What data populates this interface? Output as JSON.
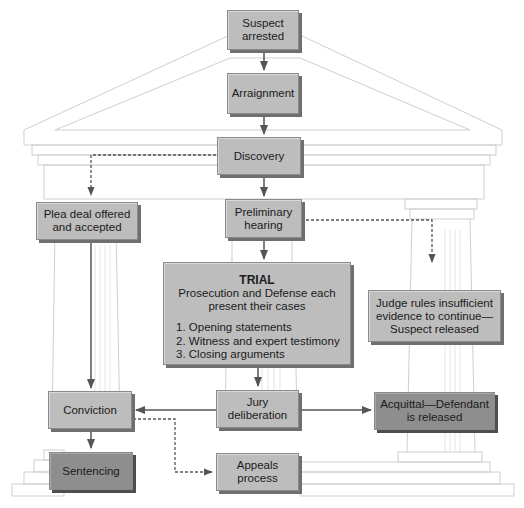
{
  "diagram": {
    "type": "flowchart",
    "theme": "criminal-justice-process-temple",
    "colors": {
      "box_fill": "#bdbdbd",
      "box_fill_dark": "#8e8e8e",
      "box_border": "#8a8a8a",
      "arrow": "#555555",
      "temple_line": "#cfcfcf"
    },
    "nodes": {
      "suspect_arrested": {
        "lines": [
          "Suspect",
          "arrested"
        ]
      },
      "arraignment": {
        "lines": [
          "Arraignment"
        ]
      },
      "discovery": {
        "lines": [
          "Discovery"
        ]
      },
      "plea_deal": {
        "lines": [
          "Plea deal offered",
          "and accepted"
        ]
      },
      "preliminary_hearing": {
        "lines": [
          "Preliminary",
          "hearing"
        ]
      },
      "trial": {
        "title": "TRIAL",
        "subtitle_lines": [
          "Prosecution and Defense each",
          "present their cases"
        ],
        "steps": [
          "1. Opening statements",
          "2. Witness and expert testimony",
          "3. Closing arguments"
        ]
      },
      "judge_rules": {
        "lines": [
          "Judge rules insufficient",
          "evidence to continue—",
          "Suspect released"
        ]
      },
      "conviction": {
        "lines": [
          "Conviction"
        ]
      },
      "jury_deliberation": {
        "lines": [
          "Jury",
          "deliberation"
        ]
      },
      "acquittal": {
        "lines": [
          "Acquittal—Defendant",
          "is released"
        ]
      },
      "sentencing": {
        "lines": [
          "Sentencing"
        ]
      },
      "appeals": {
        "lines": [
          "Appeals",
          "process"
        ]
      }
    },
    "edges": [
      {
        "from": "suspect_arrested",
        "to": "arraignment",
        "style": "solid"
      },
      {
        "from": "arraignment",
        "to": "discovery",
        "style": "solid"
      },
      {
        "from": "discovery",
        "to": "preliminary_hearing",
        "style": "solid"
      },
      {
        "from": "discovery",
        "to": "plea_deal",
        "style": "dashed"
      },
      {
        "from": "preliminary_hearing",
        "to": "trial",
        "style": "solid"
      },
      {
        "from": "preliminary_hearing",
        "to": "judge_rules",
        "style": "dashed"
      },
      {
        "from": "plea_deal",
        "to": "conviction",
        "style": "solid"
      },
      {
        "from": "trial",
        "to": "jury_deliberation",
        "style": "solid"
      },
      {
        "from": "jury_deliberation",
        "to": "conviction",
        "style": "solid"
      },
      {
        "from": "jury_deliberation",
        "to": "acquittal",
        "style": "solid"
      },
      {
        "from": "conviction",
        "to": "sentencing",
        "style": "solid"
      },
      {
        "from": "conviction",
        "to": "appeals",
        "style": "dashed"
      }
    ]
  }
}
